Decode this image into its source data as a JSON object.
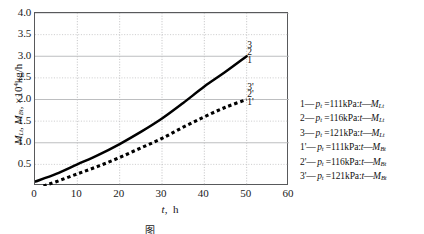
{
  "chart_data": {
    "type": "line",
    "title": "",
    "xlabel": "t,  h",
    "ylabel": "M_Lt,  M_Bt,  ×10⁴kg/h",
    "xlim": [
      0,
      60
    ],
    "ylim": [
      0,
      4.0
    ],
    "grid": true,
    "legend_position": "right-outside",
    "x_ticks": [
      0,
      10,
      20,
      30,
      40,
      50,
      60
    ],
    "y_ticks": [
      0.5,
      1.0,
      1.5,
      2.0,
      2.5,
      3.0,
      3.5,
      4.0
    ],
    "x_tick_labels": [
      "0",
      "10",
      "20",
      "30",
      "40",
      "50",
      "60"
    ],
    "y_tick_labels": [
      "0.5",
      "1.0",
      "1.5",
      "2.0",
      "2.5",
      "3.0",
      "3.5",
      "4.0"
    ],
    "series": [
      {
        "name": "M_Lt (solid band, curves 1,2,3)",
        "style": "solid",
        "color": "#000000",
        "x": [
          0,
          5,
          10,
          15,
          20,
          25,
          30,
          35,
          40,
          45,
          50
        ],
        "values": [
          0.1,
          0.28,
          0.5,
          0.72,
          0.97,
          1.25,
          1.56,
          1.92,
          2.3,
          2.64,
          3.0
        ]
      },
      {
        "name": "M_Bt (dotted band, curves 1',2',3')",
        "style": "dotted",
        "color": "#000000",
        "x": [
          2,
          5,
          10,
          15,
          20,
          25,
          30,
          35,
          40,
          45,
          50
        ],
        "values": [
          0.0,
          0.1,
          0.28,
          0.46,
          0.66,
          0.88,
          1.1,
          1.36,
          1.6,
          1.82,
          2.0
        ]
      }
    ],
    "curve_tags": [
      {
        "label": "3",
        "x": 50,
        "y": 3.22
      },
      {
        "label": "2",
        "x": 50,
        "y": 3.05
      },
      {
        "label": "1",
        "x": 50,
        "y": 2.87
      },
      {
        "label": "3'",
        "x": 50,
        "y": 2.24
      },
      {
        "label": "2'",
        "x": 50,
        "y": 2.07
      },
      {
        "label": "1'",
        "x": 50,
        "y": 1.9
      }
    ]
  },
  "axes": {
    "y_title_main": "M",
    "y_title": "M",
    "y_unit": "×10",
    "y_unit_exp": "4",
    "y_unit_tail": "kg/h",
    "y_sub_1": "Lt",
    "y_sub_2": "Bt",
    "x_title_var": "t",
    "x_title_unit": "h"
  },
  "legend": {
    "entries": [
      {
        "id": "1",
        "sep": "—",
        "var": "p",
        "var_sub": "t",
        "eq": "=111kPa:",
        "t": "t",
        "dash2": "—",
        "m": "M",
        "m_sub": "Lt"
      },
      {
        "id": "2",
        "sep": "—",
        "var": "p",
        "var_sub": "t",
        "eq": "=116kPa:",
        "t": "t",
        "dash2": "—",
        "m": "M",
        "m_sub": "Lt"
      },
      {
        "id": "3",
        "sep": "—",
        "var": "p",
        "var_sub": "t",
        "eq": "=121kPa:",
        "t": "t",
        "dash2": "—",
        "m": "M",
        "m_sub": "Lt"
      },
      {
        "id": "1'",
        "sep": "—",
        "var": "p",
        "var_sub": "t",
        "eq": "=111kPa:",
        "t": "t",
        "dash2": "—",
        "m": "M",
        "m_sub": "Bt"
      },
      {
        "id": "2'",
        "sep": "—",
        "var": "p",
        "var_sub": "t",
        "eq": "=116kPa:",
        "t": "t",
        "dash2": "—",
        "m": "M",
        "m_sub": "Bt"
      },
      {
        "id": "3'",
        "sep": "—",
        "var": "p",
        "var_sub": "t",
        "eq": "=121kPa:",
        "t": "t",
        "dash2": "—",
        "m": "M",
        "m_sub": "Bt"
      }
    ]
  },
  "caption": {
    "text": "图"
  }
}
